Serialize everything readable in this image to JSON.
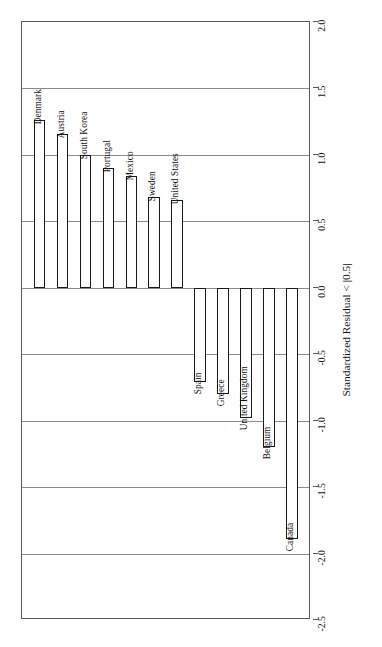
{
  "chart_data": {
    "type": "bar",
    "orientation": "vertical",
    "title": "",
    "subtitle": "",
    "xlabel": "",
    "ylabel": "Standardized Residual < |0.5|",
    "ylim": [
      -2.5,
      2.0
    ],
    "ytick_labels": [
      "2.0",
      "1.5",
      "1.0",
      "0.5",
      "0.0",
      "-0.5",
      "-1.0",
      "-1.5",
      "-2.0",
      "-2.5"
    ],
    "ytick_values": [
      2.0,
      1.5,
      1.0,
      0.5,
      0.0,
      -0.5,
      -1.0,
      -1.5,
      -2.0,
      -2.5
    ],
    "grid": true,
    "grid_axis": "y",
    "legend": "none",
    "axis_position": "right",
    "bar_fill": "#ffffff",
    "bar_edge": "#1a1a1a",
    "grid_color": "#8c8c8c",
    "frame_color": "#595959",
    "categories": [
      "Denmark",
      "Austria",
      "South Korea",
      "Portugal",
      "Mexico",
      "Sweden",
      "United States",
      "Spain",
      "Greece",
      "United Kingdom",
      "Belgium",
      "Canada"
    ],
    "values": [
      1.26,
      1.16,
      1.0,
      0.9,
      0.84,
      0.68,
      0.66,
      -0.71,
      -0.8,
      -0.98,
      -1.2,
      -1.89
    ]
  },
  "axis": {
    "title": "Standardized Residual < |0.5|"
  }
}
